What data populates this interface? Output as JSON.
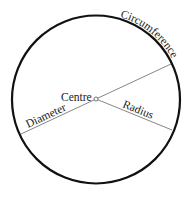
{
  "diagram": {
    "labels": {
      "circumference": "Circumference",
      "centre": "Centre",
      "diameter": "Diameter",
      "radius": "Radius"
    },
    "colors": {
      "circle_stroke": "#111111",
      "line_stroke": "#777777",
      "text": "#222222"
    }
  }
}
